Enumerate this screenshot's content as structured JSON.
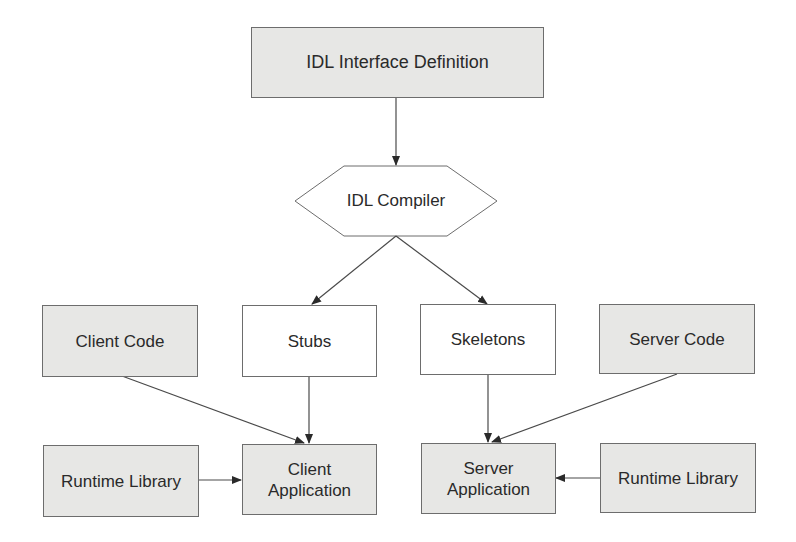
{
  "diagram": {
    "nodes": {
      "idl_definition": {
        "label": "IDL Interface Definition",
        "shape": "rectangle",
        "fill": "#e7e7e5"
      },
      "idl_compiler": {
        "label": "IDL Compiler",
        "shape": "hexagon",
        "fill": "#ffffff"
      },
      "client_code": {
        "label": "Client Code",
        "shape": "rectangle",
        "fill": "#e7e7e5"
      },
      "stubs": {
        "label": "Stubs",
        "shape": "rectangle",
        "fill": "#ffffff"
      },
      "skeletons": {
        "label": "Skeletons",
        "shape": "rectangle",
        "fill": "#ffffff"
      },
      "server_code": {
        "label": "Server Code",
        "shape": "rectangle",
        "fill": "#e7e7e5"
      },
      "runtime_library_client": {
        "label": "Runtime Library",
        "shape": "rectangle",
        "fill": "#e7e7e5"
      },
      "client_application": {
        "label_line1": "Client",
        "label_line2": "Application",
        "shape": "rectangle",
        "fill": "#e7e7e5"
      },
      "server_application": {
        "label_line1": "Server",
        "label_line2": "Application",
        "shape": "rectangle",
        "fill": "#e7e7e5"
      },
      "runtime_library_server": {
        "label": "Runtime Library",
        "shape": "rectangle",
        "fill": "#e7e7e5"
      }
    },
    "edges": [
      {
        "from": "IDL Interface Definition",
        "to": "IDL Compiler"
      },
      {
        "from": "IDL Compiler",
        "to": "Stubs"
      },
      {
        "from": "IDL Compiler",
        "to": "Skeletons"
      },
      {
        "from": "Client Code",
        "to": "Client Application"
      },
      {
        "from": "Stubs",
        "to": "Client Application"
      },
      {
        "from": "Runtime Library",
        "to": "Client Application"
      },
      {
        "from": "Skeletons",
        "to": "Server Application"
      },
      {
        "from": "Server Code",
        "to": "Server Application"
      },
      {
        "from": "Runtime Library",
        "to": "Server Application"
      }
    ],
    "colors": {
      "line": "#4a4a4a",
      "border": "#6d6d6d",
      "shaded_fill": "#e7e7e5"
    }
  }
}
